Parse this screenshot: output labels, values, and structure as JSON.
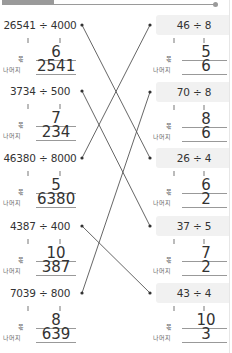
{
  "header": {
    "accent_color": "#9a9a9a"
  },
  "labels": {
    "quotient": "몫",
    "remainder": "나머지"
  },
  "left_problems": [
    {
      "expression": "26541 ÷ 4000",
      "quotient": "6",
      "remainder": "2541"
    },
    {
      "expression": "3734 ÷ 500",
      "quotient": "7",
      "remainder": "234"
    },
    {
      "expression": "46380 ÷ 8000",
      "quotient": "5",
      "remainder": "6380"
    },
    {
      "expression": "4387 ÷ 400",
      "quotient": "10",
      "remainder": "387"
    },
    {
      "expression": "7039 ÷ 800",
      "quotient": "8",
      "remainder": "639"
    }
  ],
  "right_problems": [
    {
      "expression": "46 ÷ 8",
      "quotient": "5",
      "remainder": "6"
    },
    {
      "expression": "70 ÷ 8",
      "quotient": "8",
      "remainder": "6"
    },
    {
      "expression": "26 ÷ 4",
      "quotient": "6",
      "remainder": "2"
    },
    {
      "expression": "37 ÷ 5",
      "quotient": "7",
      "remainder": "2"
    },
    {
      "expression": "43 ÷ 4",
      "quotient": "10",
      "remainder": "3"
    }
  ],
  "connections": [
    {
      "left": 1,
      "right": 3
    },
    {
      "left": 2,
      "right": 4
    },
    {
      "left": 3,
      "right": 1
    },
    {
      "left": 4,
      "right": 5
    },
    {
      "left": 5,
      "right": 2
    }
  ]
}
